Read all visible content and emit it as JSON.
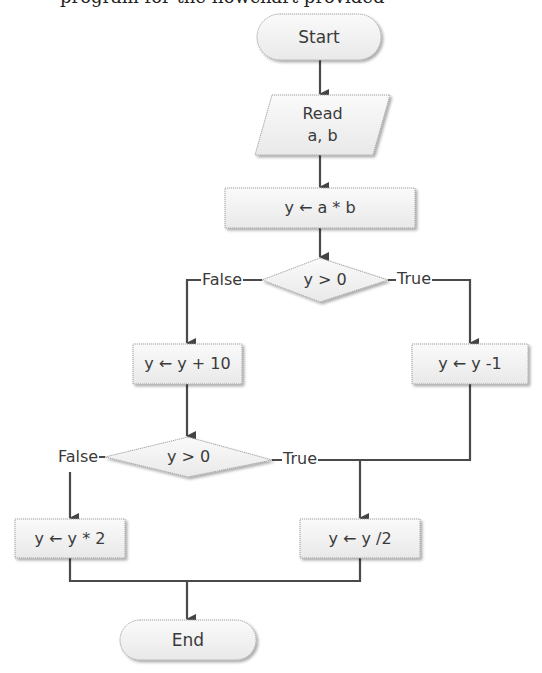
{
  "diagram": {
    "type": "flowchart",
    "top_cut_text": "program for the flowchart provided",
    "nodes": {
      "start": {
        "shape": "terminator",
        "label": "Start"
      },
      "read": {
        "shape": "parallelogram",
        "line1": "Read",
        "line2": "a, b"
      },
      "assign_ab": {
        "shape": "process",
        "label": "y ← a * b"
      },
      "decision1": {
        "shape": "decision",
        "label": "y > 0"
      },
      "add10": {
        "shape": "process",
        "label": "y ← y + 10"
      },
      "sub1": {
        "shape": "process",
        "label": "y ← y -1"
      },
      "decision2": {
        "shape": "decision",
        "label": "y > 0"
      },
      "mul2": {
        "shape": "process",
        "label": "y ← y * 2"
      },
      "div2": {
        "shape": "process",
        "label": "y ← y /2"
      },
      "end": {
        "shape": "terminator",
        "label": "End"
      }
    },
    "edges": {
      "d1_false": "False",
      "d1_true": "True",
      "d2_false": "False",
      "d2_true": "True"
    },
    "colors": {
      "line": "#4a4a4a",
      "node_fill": "#f2f2f2",
      "node_border": "#9a9a9a",
      "shadow": "#d0d0d0"
    }
  }
}
